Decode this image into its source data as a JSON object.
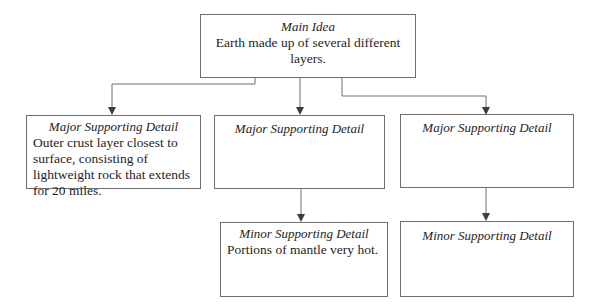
{
  "main_idea": {
    "title": "Main Idea",
    "text": "Earth made up of several different layers."
  },
  "major_details": [
    {
      "title": "Major Supporting Detail",
      "text": "Outer crust layer closest to surface, consisting of lightweight rock that extends for 20 miles."
    },
    {
      "title": "Major Supporting Detail",
      "text": ""
    },
    {
      "title": "Major Supporting Detail",
      "text": ""
    }
  ],
  "minor_details": [
    {
      "parent": 1,
      "title": "Minor Supporting Detail",
      "text": "Portions of mantle very hot."
    },
    {
      "parent": 2,
      "title": "Minor Supporting Detail",
      "text": ""
    }
  ],
  "colors": {
    "line": "#6e6e6e",
    "arrow": "#3c3c3c",
    "text": "#1e1e1e"
  }
}
